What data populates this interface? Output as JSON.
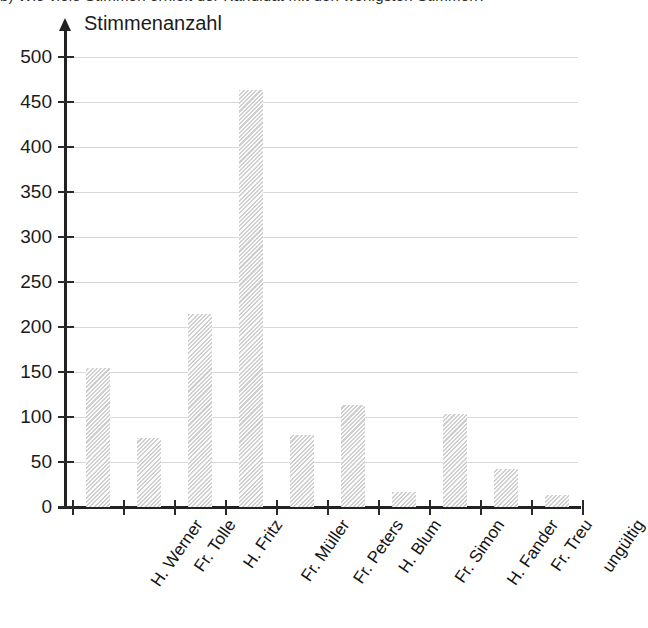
{
  "page": {
    "cut_off_line_top": "b) Wie viele Stimmen erhielt der Kandidat mit den wenigsten Stimmen?"
  },
  "chart_data": {
    "type": "bar",
    "title": "",
    "subtitle": "",
    "xlabel": "",
    "ylabel": "Stimmenanzahl",
    "categories": [
      "H. Werner",
      "Fr. Tolle",
      "H. Fritz",
      "Fr. Müller",
      "Fr. Peters",
      "H. Blum",
      "Fr. Simon",
      "H. Fander",
      "Fr. Treu",
      "ungültig"
    ],
    "values": [
      154,
      77,
      214,
      463,
      80,
      113,
      17,
      103,
      42,
      13
    ],
    "ylim": [
      0,
      500
    ],
    "ytick_labels": [
      "0",
      "50",
      "100",
      "150",
      "200",
      "250",
      "300",
      "350",
      "400",
      "450",
      "500"
    ],
    "ytick_values": [
      0,
      50,
      100,
      150,
      200,
      250,
      300,
      350,
      400,
      450,
      500
    ],
    "grid": "horizontal",
    "legend": "none",
    "colors": {
      "bar_fill": "#e3e3e3",
      "bar_hatch": "#bebebe",
      "gridline": "#d8d8d8",
      "axis": "#222222",
      "text": "#1b1b1b",
      "background": "#ffffff"
    }
  }
}
